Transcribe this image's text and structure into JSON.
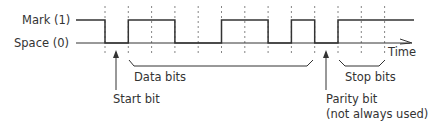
{
  "labels": {
    "mark": "Mark (1)",
    "space": "Space (0)",
    "time": "Time",
    "data_bits": "Data bits",
    "stop_bits": "Stop bits",
    "start_bit": "Start bit",
    "parity_bit": "Parity bit",
    "parity_note": "(not always used)"
  },
  "signal": {
    "idle_level": 1,
    "start_bit": 0,
    "data_bits": [
      1,
      1,
      0,
      0,
      1,
      1,
      0,
      1
    ],
    "parity_bit": 0,
    "stop_bits": [
      1,
      1
    ]
  },
  "colors": {
    "line": "#333333",
    "grid": "#666666"
  }
}
